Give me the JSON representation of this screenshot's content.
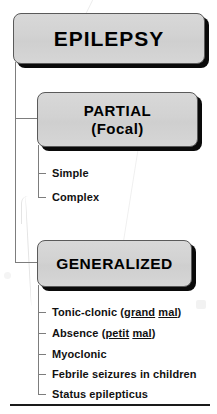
{
  "diagram": {
    "title": "EPILEPSY",
    "root": {
      "label": "EPILEPSY"
    },
    "branches": [
      {
        "id": "partial",
        "label": "PARTIAL",
        "sublabel": "(Focal)",
        "items": [
          {
            "text": "Simple"
          },
          {
            "text": "Complex"
          }
        ]
      },
      {
        "id": "generalized",
        "label": "GENERALIZED",
        "sublabel": "",
        "items": [
          {
            "text": "Tonic-clonic (",
            "em1": "grand",
            "mid": " ",
            "em2": "mal",
            "tail": ")"
          },
          {
            "text": "Absence (",
            "em1": "petit",
            "mid": " ",
            "em2": "mal",
            "tail": ")"
          },
          {
            "text": "Myoclonic"
          },
          {
            "text": "Febrile seizures in children"
          },
          {
            "text": "Status epilepticus"
          }
        ]
      }
    ]
  },
  "labels": {
    "simple": "Simple",
    "complex": "Complex",
    "tonic_clonic_pre": "Tonic-clonic (",
    "tonic_clonic_em1": "grand",
    "tonic_clonic_em2": "mal",
    "tonic_clonic_post": ")",
    "absence_pre": "Absence (",
    "absence_em1": "petit",
    "absence_em2": "mal",
    "absence_post": ")",
    "myoclonic": "Myoclonic",
    "febrile": "Febrile seizures in children",
    "status": "Status epilepticus"
  },
  "colors": {
    "box_fill": "#d4d4d4",
    "box_border": "#5a5a5a",
    "shadow": "#0a0a0a",
    "connector": "#7d7d7d",
    "text": "#000000",
    "rule": "#1a1a1a"
  }
}
